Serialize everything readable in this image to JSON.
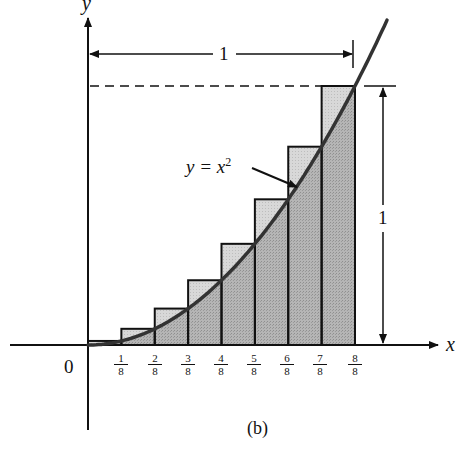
{
  "figure": {
    "caption": "(b)",
    "x_axis_label": "x",
    "y_axis_label": "y",
    "origin_label": "0",
    "curve_label": "y = x",
    "curve_label_exponent": "2",
    "width_dimension_label": "1",
    "height_dimension_label": "1",
    "tick_labels": [
      {
        "num": "1",
        "den": "8"
      },
      {
        "num": "2",
        "den": "8"
      },
      {
        "num": "3",
        "den": "8"
      },
      {
        "num": "4",
        "den": "8"
      },
      {
        "num": "5",
        "den": "8"
      },
      {
        "num": "6",
        "den": "8"
      },
      {
        "num": "7",
        "den": "8"
      },
      {
        "num": "8",
        "den": "8"
      }
    ],
    "colors": {
      "ink": "#111111",
      "curve": "#333333",
      "shade_under_curve": "#a9a9a9",
      "shade_excess": "#cfcfcf"
    }
  },
  "chart_data": {
    "type": "area",
    "function": "y = x^2",
    "xlabel": "x",
    "ylabel": "y",
    "xlim": [
      0,
      1
    ],
    "ylim": [
      0,
      1
    ],
    "x_ticks": [
      "1/8",
      "2/8",
      "3/8",
      "4/8",
      "5/8",
      "6/8",
      "7/8",
      "8/8"
    ],
    "rectangles": [
      {
        "x0": 0.0,
        "x1": 0.125,
        "height": 0.015625
      },
      {
        "x0": 0.125,
        "x1": 0.25,
        "height": 0.0625
      },
      {
        "x0": 0.25,
        "x1": 0.375,
        "height": 0.140625
      },
      {
        "x0": 0.375,
        "x1": 0.5,
        "height": 0.25
      },
      {
        "x0": 0.5,
        "x1": 0.625,
        "height": 0.390625
      },
      {
        "x0": 0.625,
        "x1": 0.75,
        "height": 0.5625
      },
      {
        "x0": 0.75,
        "x1": 0.875,
        "height": 0.765625
      },
      {
        "x0": 0.875,
        "x1": 1.0,
        "height": 1.0
      }
    ],
    "annotations": [
      "width = 1",
      "height = 1",
      "dashed line at y = 1",
      "(b)"
    ],
    "grid": false
  }
}
